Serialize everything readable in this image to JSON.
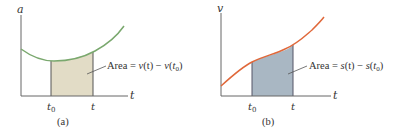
{
  "panels": [
    {
      "id": "a",
      "caption": "(a)",
      "y_axis_label": "a",
      "x_axis_label": "t",
      "tick_labels": {
        "t0": "t",
        "t0_sub": "0",
        "t": "t"
      },
      "area_label": {
        "prefix": "Area = ",
        "f": "v",
        "expr_t": "(t)",
        "minus": " − ",
        "f2": "v",
        "open": "(",
        "t0": "t",
        "t0_sub": "0",
        "close": ")"
      },
      "colors": {
        "curve": "#7aa86e",
        "fill": "#e2dcc6",
        "axis": "#555555"
      }
    },
    {
      "id": "b",
      "caption": "(b)",
      "y_axis_label": "v",
      "x_axis_label": "t",
      "tick_labels": {
        "t0": "t",
        "t0_sub": "0",
        "t": "t"
      },
      "area_label": {
        "prefix": "Area = ",
        "f": "s",
        "expr_t": "(t)",
        "minus": " − ",
        "f2": "s",
        "open": "(",
        "t0": "t",
        "t0_sub": "0",
        "close": ")"
      },
      "colors": {
        "curve": "#e0683a",
        "fill": "#a9b7c3",
        "axis": "#555555"
      }
    }
  ]
}
